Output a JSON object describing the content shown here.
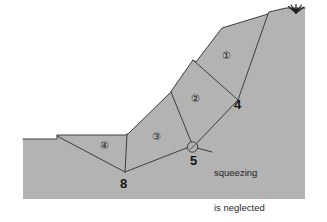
{
  "figure": {
    "colors": {
      "ground_fill": "#b3b3b3",
      "outline": "#3d3d3d",
      "background": "#ffffff",
      "text": "#1c1c1c"
    },
    "blocks": [
      {
        "id": "block-1",
        "label": "①",
        "x": 228,
        "y": 58
      },
      {
        "id": "block-2",
        "label": "②",
        "x": 197,
        "y": 101
      },
      {
        "id": "block-3",
        "label": "③",
        "x": 158,
        "y": 139
      },
      {
        "id": "block-4",
        "label": "④",
        "x": 106,
        "y": 148
      }
    ],
    "nodes": [
      {
        "id": "node-4",
        "label": "4",
        "x": 239,
        "y": 107
      },
      {
        "id": "node-5",
        "label": "5",
        "x": 195,
        "y": 163
      },
      {
        "id": "node-8",
        "label": "8",
        "x": 125,
        "y": 186
      }
    ],
    "annotation": {
      "line1": "squeezing",
      "line2": "is neglected",
      "x": 214,
      "y": 149
    },
    "vegetation": {
      "name": "grass-sprig",
      "x": 296,
      "y": 13
    }
  }
}
